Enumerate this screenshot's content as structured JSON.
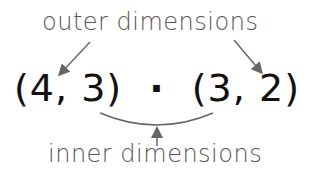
{
  "labels": {
    "outer": "outer dimensions",
    "inner": "inner dimensions"
  },
  "expression": {
    "left_matrix": "(4, 3)",
    "operator": "·",
    "right_matrix": "(3, 2)"
  },
  "colors": {
    "label_text": "#555555",
    "expression_text": "#111111",
    "arrows": "#666666"
  }
}
